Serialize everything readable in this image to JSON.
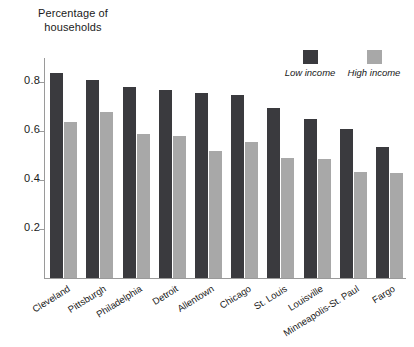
{
  "chart_data": {
    "type": "bar",
    "title": "Percentage of households",
    "title_lines": [
      "Percentage of",
      "households"
    ],
    "xlabel": "",
    "ylabel": "Percentage of households",
    "ylim": [
      0,
      0.9
    ],
    "grid": false,
    "legend_position": "top-right",
    "ytick_labels": [
      "0.2",
      "0.4",
      "0.6",
      "0.8"
    ],
    "ytick_values": [
      0.2,
      0.4,
      0.6,
      0.8
    ],
    "categories": [
      "Cleveland",
      "Pittsburgh",
      "Philadelphia",
      "Detroit",
      "Allentown",
      "Chicago",
      "St. Louis",
      "Louisville",
      "Minneapolis-St. Paul",
      "Fargo"
    ],
    "series": [
      {
        "name": "Low income",
        "color": "#3a3a3e",
        "values": [
          0.84,
          0.81,
          0.78,
          0.77,
          0.755,
          0.75,
          0.695,
          0.65,
          0.61,
          0.535
        ]
      },
      {
        "name": "High income",
        "color": "#a8a8a8",
        "values": [
          0.64,
          0.68,
          0.59,
          0.58,
          0.52,
          0.555,
          0.49,
          0.485,
          0.435,
          0.43
        ]
      }
    ]
  },
  "colors": {
    "low_income": "#3a3a3e",
    "high_income": "#a8a8a8",
    "axis": "#9a9a9a",
    "text": "#1a1a1a",
    "background": "#ffffff"
  }
}
